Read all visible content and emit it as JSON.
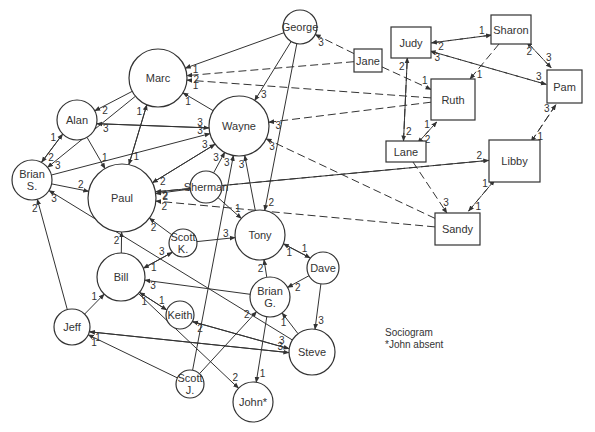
{
  "legend": {
    "title": "Sociogram",
    "note": "*John absent"
  },
  "nodes": [
    {
      "id": "george",
      "label": "George",
      "shape": "circle",
      "x": 300,
      "y": 27,
      "r": 17
    },
    {
      "id": "marc",
      "label": "Marc",
      "shape": "circle",
      "x": 158,
      "y": 78,
      "r": 29
    },
    {
      "id": "alan",
      "label": "Alan",
      "shape": "circle",
      "x": 77,
      "y": 120,
      "r": 20
    },
    {
      "id": "wayne",
      "label": "Wayne",
      "shape": "circle",
      "x": 239,
      "y": 126,
      "r": 30
    },
    {
      "id": "brians",
      "label": "Brian S.",
      "shape": "circle",
      "x": 32,
      "y": 180,
      "r": 20
    },
    {
      "id": "paul",
      "label": "Paul",
      "shape": "circle",
      "x": 122,
      "y": 198,
      "r": 34
    },
    {
      "id": "sherman",
      "label": "Sherman",
      "shape": "circle",
      "x": 206,
      "y": 187,
      "r": 16
    },
    {
      "id": "tony",
      "label": "Tony",
      "shape": "circle",
      "x": 260,
      "y": 235,
      "r": 25
    },
    {
      "id": "scottk",
      "label": "Scott K.",
      "shape": "circle",
      "x": 183,
      "y": 243,
      "r": 14
    },
    {
      "id": "bill",
      "label": "Bill",
      "shape": "circle",
      "x": 121,
      "y": 277,
      "r": 24
    },
    {
      "id": "dave",
      "label": "Dave",
      "shape": "circle",
      "x": 323,
      "y": 268,
      "r": 16
    },
    {
      "id": "briang",
      "label": "Brian G.",
      "shape": "circle",
      "x": 270,
      "y": 297,
      "r": 20
    },
    {
      "id": "keith",
      "label": "Keith",
      "shape": "circle",
      "x": 180,
      "y": 315,
      "r": 14
    },
    {
      "id": "jeff",
      "label": "Jeff",
      "shape": "circle",
      "x": 72,
      "y": 327,
      "r": 18
    },
    {
      "id": "steve",
      "label": "Steve",
      "shape": "circle",
      "x": 312,
      "y": 352,
      "r": 23
    },
    {
      "id": "scottj",
      "label": "Scott J.",
      "shape": "circle",
      "x": 190,
      "y": 384,
      "r": 14
    },
    {
      "id": "john",
      "label": "John*",
      "shape": "circle",
      "x": 253,
      "y": 402,
      "r": 20
    },
    {
      "id": "jane",
      "label": "Jane",
      "shape": "rect",
      "x": 354,
      "y": 49,
      "w": 28,
      "h": 23
    },
    {
      "id": "judy",
      "label": "Judy",
      "shape": "rect",
      "x": 391,
      "y": 27,
      "w": 40,
      "h": 31
    },
    {
      "id": "sharon",
      "label": "Sharon",
      "shape": "rect",
      "x": 491,
      "y": 15,
      "w": 40,
      "h": 29
    },
    {
      "id": "ruth",
      "label": "Ruth",
      "shape": "rect",
      "x": 431,
      "y": 79,
      "w": 44,
      "h": 41
    },
    {
      "id": "pam",
      "label": "Pam",
      "shape": "rect",
      "x": 547,
      "y": 70,
      "w": 35,
      "h": 33
    },
    {
      "id": "lane",
      "label": "Lane",
      "shape": "rect",
      "x": 386,
      "y": 141,
      "w": 40,
      "h": 21
    },
    {
      "id": "libby",
      "label": "Libby",
      "shape": "rect",
      "x": 489,
      "y": 140,
      "w": 51,
      "h": 42
    },
    {
      "id": "sandy",
      "label": "Sandy",
      "shape": "rect",
      "x": 435,
      "y": 213,
      "w": 45,
      "h": 32
    }
  ],
  "edges": [
    {
      "from": "george",
      "to": "marc",
      "label": "1",
      "dashed": false
    },
    {
      "from": "jane",
      "to": "marc",
      "label": "2",
      "dashed": true
    },
    {
      "from": "ruth",
      "to": "marc",
      "label": "1",
      "dashed": true
    },
    {
      "from": "jane",
      "to": "george",
      "label": "3",
      "dashed": true
    },
    {
      "from": "jane",
      "to": "ruth",
      "label": "1",
      "dashed": true
    },
    {
      "from": "george",
      "to": "wayne",
      "label": "3",
      "dashed": false
    },
    {
      "from": "george",
      "to": "tony",
      "label": "2",
      "dashed": false
    },
    {
      "from": "ruth",
      "to": "wayne",
      "label": "3",
      "dashed": true
    },
    {
      "from": "marc",
      "to": "alan",
      "label": "2",
      "dashed": false
    },
    {
      "from": "wayne",
      "to": "marc",
      "label": "1",
      "dashed": false
    },
    {
      "from": "marc",
      "to": "brians",
      "label": "3",
      "dashed": false
    },
    {
      "from": "paul",
      "to": "marc",
      "label": "1",
      "dashed": false
    },
    {
      "from": "marc",
      "to": "paul",
      "label": "1",
      "dashed": false
    },
    {
      "from": "alan",
      "to": "wayne",
      "label": "3",
      "dashed": false
    },
    {
      "from": "wayne",
      "to": "alan",
      "label": "3",
      "dashed": false
    },
    {
      "from": "alan",
      "to": "brians",
      "label": "2",
      "dashed": false
    },
    {
      "from": "brians",
      "to": "alan",
      "label": "1",
      "dashed": false
    },
    {
      "from": "alan",
      "to": "paul",
      "label": "1",
      "dashed": false
    },
    {
      "from": "brians",
      "to": "wayne",
      "label": "3",
      "dashed": false
    },
    {
      "from": "brians",
      "to": "paul",
      "label": "2",
      "dashed": false
    },
    {
      "from": "paul",
      "to": "wayne",
      "label": "3",
      "dashed": false
    },
    {
      "from": "wayne",
      "to": "paul",
      "label": "2",
      "dashed": false
    },
    {
      "from": "sherman",
      "to": "wayne",
      "label": "3",
      "dashed": false
    },
    {
      "from": "sherman",
      "to": "paul",
      "label": "2",
      "dashed": false
    },
    {
      "from": "sherman",
      "to": "tony",
      "label": "1",
      "dashed": false
    },
    {
      "from": "tony",
      "to": "wayne",
      "label": "3",
      "dashed": false
    },
    {
      "from": "scottj",
      "to": "wayne",
      "label": "3",
      "dashed": false
    },
    {
      "from": "sandy",
      "to": "wayne",
      "label": "3",
      "dashed": true
    },
    {
      "from": "libby",
      "to": "paul",
      "label": "2",
      "dashed": true
    },
    {
      "from": "paul",
      "to": "libby",
      "label": "2",
      "dashed": false
    },
    {
      "from": "sandy",
      "to": "paul",
      "label": "2",
      "dashed": true
    },
    {
      "from": "steve",
      "to": "brians",
      "label": "3",
      "dashed": false
    },
    {
      "from": "jeff",
      "to": "brians",
      "label": "2",
      "dashed": false
    },
    {
      "from": "bill",
      "to": "paul",
      "label": "2",
      "dashed": false
    },
    {
      "from": "scottk",
      "to": "paul",
      "label": "2",
      "dashed": false
    },
    {
      "from": "bill",
      "to": "scottk",
      "label": "3",
      "dashed": false
    },
    {
      "from": "scottk",
      "to": "bill",
      "label": "1",
      "dashed": false
    },
    {
      "from": "scottk",
      "to": "tony",
      "label": "3",
      "dashed": false
    },
    {
      "from": "tony",
      "to": "dave",
      "label": "1",
      "dashed": false
    },
    {
      "from": "dave",
      "to": "tony",
      "label": "1",
      "dashed": false
    },
    {
      "from": "briang",
      "to": "tony",
      "label": "2",
      "dashed": false
    },
    {
      "from": "dave",
      "to": "briang",
      "label": "2",
      "dashed": false
    },
    {
      "from": "dave",
      "to": "steve",
      "label": "3",
      "dashed": false
    },
    {
      "from": "briang",
      "to": "bill",
      "label": "3",
      "dashed": false
    },
    {
      "from": "keith",
      "to": "bill",
      "label": "1",
      "dashed": false
    },
    {
      "from": "bill",
      "to": "keith",
      "label": "1",
      "dashed": false
    },
    {
      "from": "jeff",
      "to": "bill",
      "label": "1",
      "dashed": false
    },
    {
      "from": "steve",
      "to": "briang",
      "label": "1",
      "dashed": false
    },
    {
      "from": "keith",
      "to": "steve",
      "label": "3",
      "dashed": false
    },
    {
      "from": "steve",
      "to": "keith",
      "label": "2",
      "dashed": false
    },
    {
      "from": "jeff",
      "to": "steve",
      "label": "3",
      "dashed": false
    },
    {
      "from": "steve",
      "to": "jeff",
      "label": "1",
      "dashed": false
    },
    {
      "from": "scottj",
      "to": "jeff",
      "label": "1",
      "dashed": false
    },
    {
      "from": "scottj",
      "to": "briang",
      "label": "2",
      "dashed": false
    },
    {
      "from": "briang",
      "to": "john",
      "label": "1",
      "dashed": false
    },
    {
      "from": "bill",
      "to": "john",
      "label": "2",
      "dashed": false
    },
    {
      "from": "judy",
      "to": "sharon",
      "label": "1",
      "dashed": true
    },
    {
      "from": "sharon",
      "to": "judy",
      "label": "2",
      "dashed": true
    },
    {
      "from": "pam",
      "to": "judy",
      "label": "3",
      "dashed": true
    },
    {
      "from": "judy",
      "to": "pam",
      "label": "3",
      "dashed": true
    },
    {
      "from": "sharon",
      "to": "pam",
      "label": "3",
      "dashed": true
    },
    {
      "from": "pam",
      "to": "sharon",
      "label": "2",
      "dashed": true
    },
    {
      "from": "sharon",
      "to": "ruth",
      "label": "1",
      "dashed": true
    },
    {
      "from": "lane",
      "to": "judy",
      "label": "2",
      "dashed": true
    },
    {
      "from": "judy",
      "to": "lane",
      "label": "2",
      "dashed": false
    },
    {
      "from": "lane",
      "to": "ruth",
      "label": "1",
      "dashed": true
    },
    {
      "from": "ruth",
      "to": "lane",
      "label": "2",
      "dashed": true
    },
    {
      "from": "libby",
      "to": "pam",
      "label": "3",
      "dashed": true
    },
    {
      "from": "pam",
      "to": "libby",
      "label": "1",
      "dashed": true
    },
    {
      "from": "lane",
      "to": "sandy",
      "label": "3",
      "dashed": true
    },
    {
      "from": "sandy",
      "to": "libby",
      "label": "1",
      "dashed": true
    },
    {
      "from": "libby",
      "to": "sandy",
      "label": "1",
      "dashed": true
    }
  ]
}
